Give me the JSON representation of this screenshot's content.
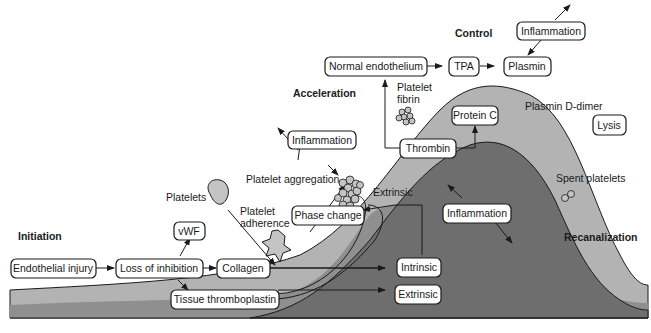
{
  "colors": {
    "background": "#ffffff",
    "band_light": "#b3b3b3",
    "band_mid": "#8f8f8f",
    "band_dark": "#6e6e6e",
    "platelet_fill": "#c4c4c4",
    "stroke": "#1a1a1a"
  },
  "phases": {
    "initiation": "Initiation",
    "acceleration": "Acceleration",
    "control": "Control",
    "recanalization": "Recanalization"
  },
  "boxes": {
    "endothelial_injury": "Endothelial injury",
    "loss_of_inhibition": "Loss of inhibition",
    "collagen": "Collagen",
    "vwf": "vWF",
    "tissue_thromboplastin": "Tissue thromboplastin",
    "phase_change": "Phase change",
    "inflammation_accel": "Inflammation",
    "thrombin": "Thrombin",
    "protein_c": "Protein C",
    "normal_endothelium": "Normal endothelium",
    "tpa": "TPA",
    "plasmin": "Plasmin",
    "inflammation_control": "Inflammation",
    "inflammation_center": "Inflammation",
    "intrinsic": "Intrinsic",
    "extrinsic_box": "Extrinsic",
    "lysis": "Lysis"
  },
  "labels": {
    "platelets": "Platelets",
    "platelet_adherence_1": "Platelet",
    "platelet_adherence_2": "adherence",
    "platelet_aggregation": "Platelet aggregation",
    "extrinsic_curve": "Extrinsic",
    "platelet_fibrin_1": "Platelet",
    "platelet_fibrin_2": "fibrin",
    "plasmin_ddimer": "Plasmin D-dimer",
    "spent_platelets": "Spent platelets"
  }
}
